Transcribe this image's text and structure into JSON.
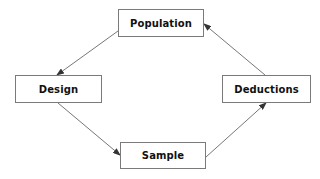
{
  "diagram": {
    "type": "cycle-flowchart",
    "nodes": [
      {
        "id": "population",
        "label": "Population"
      },
      {
        "id": "design",
        "label": "Design"
      },
      {
        "id": "sample",
        "label": "Sample"
      },
      {
        "id": "deductions",
        "label": "Deductions"
      }
    ],
    "edges": [
      {
        "from": "population",
        "to": "design"
      },
      {
        "from": "design",
        "to": "sample"
      },
      {
        "from": "sample",
        "to": "deductions"
      },
      {
        "from": "deductions",
        "to": "population"
      }
    ],
    "colors": {
      "border": "#7a7a7a",
      "arrow": "#555555",
      "text": "#111111",
      "background": "#ffffff"
    }
  }
}
